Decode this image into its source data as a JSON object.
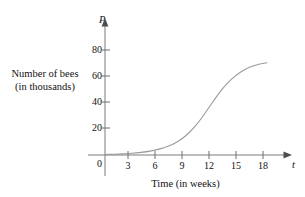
{
  "chart_data": {
    "type": "line",
    "title": "",
    "xlabel": "Time (in weeks)",
    "ylabel_line1": "Number of bees",
    "ylabel_line2": "(in thousands)",
    "x_variable": "t",
    "y_variable": "P",
    "origin_label": "0",
    "xticks": [
      3,
      6,
      9,
      12,
      15,
      18
    ],
    "xtick_labels": [
      "3",
      "6",
      "9",
      "12",
      "15",
      "18"
    ],
    "yticks": [
      20,
      40,
      60,
      80
    ],
    "ytick_labels": [
      "20",
      "40",
      "60",
      "80"
    ],
    "xlim": [
      0,
      19.5
    ],
    "ylim": [
      0,
      90
    ],
    "grid": false,
    "legend": false,
    "curve_color": "#9a9a9a",
    "axis_color": "#6f6f6f",
    "x": [
      0,
      1,
      2,
      3,
      4,
      5,
      6,
      7,
      8,
      9,
      10,
      11,
      12,
      13,
      14,
      15,
      16,
      17,
      18
    ],
    "values": [
      0.4,
      0.6,
      0.9,
      1.3,
      2.0,
      3.0,
      4.5,
      6.7,
      10.0,
      15.0,
      22.0,
      31.0,
      41.0,
      50.5,
      58.0,
      63.5,
      67.3,
      69.6,
      71.0
    ],
    "series": [
      {
        "name": "Bee population",
        "values": [
          0.4,
          0.6,
          0.9,
          1.3,
          2.0,
          3.0,
          4.5,
          6.7,
          10.0,
          15.0,
          22.0,
          31.0,
          41.0,
          50.5,
          58.0,
          63.5,
          67.3,
          69.6,
          71.0
        ]
      }
    ],
    "annotations": []
  }
}
